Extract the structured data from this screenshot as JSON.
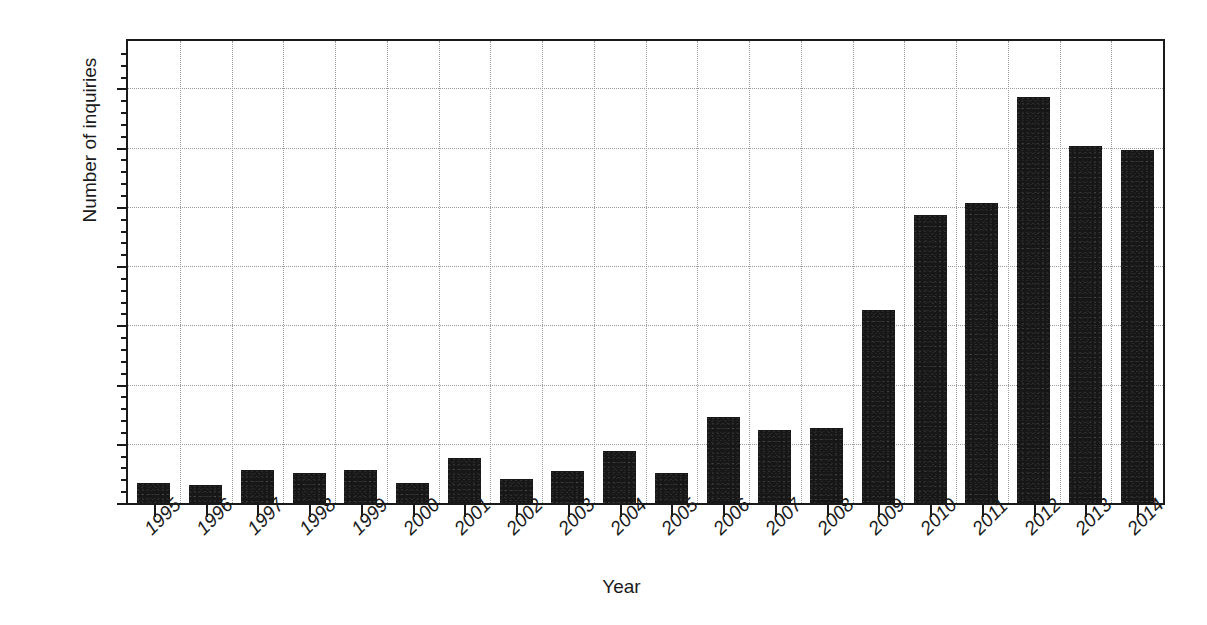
{
  "chart_data": {
    "type": "bar",
    "title": "",
    "xlabel": "Year",
    "ylabel": "Number of inquiries",
    "categories": [
      "1995",
      "1996",
      "1997",
      "1998",
      "1999",
      "2000",
      "2001",
      "2002",
      "2003",
      "2004",
      "2005",
      "2006",
      "2007",
      "2008",
      "2009",
      "2010",
      "2011",
      "2012",
      "2013",
      "2014"
    ],
    "values": [
      17,
      15,
      28,
      25,
      28,
      17,
      38,
      20,
      27,
      44,
      25,
      73,
      62,
      63,
      163,
      243,
      253,
      343,
      301,
      298
    ],
    "series": [
      {
        "name": "Number of inquiries",
        "values": [
          17,
          15,
          28,
          25,
          28,
          17,
          38,
          20,
          27,
          44,
          25,
          73,
          62,
          63,
          163,
          243,
          253,
          343,
          301,
          298
        ]
      }
    ],
    "ylim": [
      0,
      390
    ],
    "yticks": [
      0,
      50,
      100,
      150,
      200,
      250,
      300,
      350
    ],
    "ytick_labels": [
      "0",
      "50",
      "100",
      "150",
      "200",
      "250",
      "300",
      "350"
    ],
    "yticks_minor": [
      10,
      20,
      30,
      40,
      60,
      70,
      80,
      90,
      110,
      120,
      130,
      140,
      160,
      170,
      180,
      190,
      210,
      220,
      230,
      240,
      260,
      270,
      280,
      290,
      310,
      320,
      330,
      340,
      360,
      370,
      380
    ],
    "grid": true,
    "grid_style": "dotted",
    "legend": false,
    "legend_position": "none",
    "bar_color": "#171717",
    "axis_color": "#1a1a1a",
    "grid_color": "#9a9a9a",
    "background_color": "#ffffff",
    "xtick_label_rotation": -45
  }
}
